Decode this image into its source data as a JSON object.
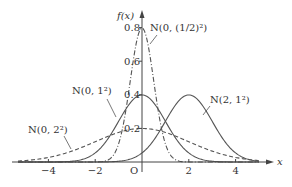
{
  "chart_data": {
    "type": "line",
    "title": "",
    "xlabel": "x",
    "ylabel": "f(x)",
    "xlim": [
      -5.3,
      5
    ],
    "ylim": [
      0,
      0.85
    ],
    "grid": false,
    "legend_position": "inline labels",
    "origin_label": "O",
    "x_ticks": [
      {
        "value": -4,
        "label": "−4"
      },
      {
        "value": -2,
        "label": "−2"
      },
      {
        "value": 2,
        "label": "2"
      },
      {
        "value": 4,
        "label": "4"
      }
    ],
    "y_ticks": [
      {
        "value": 0.2,
        "label": "0.2"
      },
      {
        "value": 0.4,
        "label": "0.4"
      },
      {
        "value": 0.6,
        "label": "0.6"
      },
      {
        "value": 0.8,
        "label": "0.8"
      }
    ],
    "series": [
      {
        "name": "N(0, (1/2)²)",
        "mu": 0,
        "sigma": 0.5,
        "peak": 0.798,
        "style": "dash-dot",
        "label_pos": [
          150,
          31
        ],
        "leader": [
          [
            157,
            35
          ],
          [
            150,
            44
          ]
        ]
      },
      {
        "name": "N(0, 1²)",
        "mu": 0,
        "sigma": 1,
        "peak": 0.399,
        "style": "solid",
        "label_pos": [
          72,
          94
        ],
        "leader": [
          [
            107,
            99
          ],
          [
            116,
            117
          ]
        ]
      },
      {
        "name": "N(2, 1²)",
        "mu": 2,
        "sigma": 1,
        "peak": 0.399,
        "style": "solid",
        "label_pos": [
          210,
          103
        ],
        "leader": [
          [
            210,
            106
          ],
          [
            203,
            115
          ]
        ]
      },
      {
        "name": "N(0, 2²)",
        "mu": 0,
        "sigma": 2,
        "peak": 0.199,
        "style": "dashed",
        "label_pos": [
          28,
          133
        ],
        "leader": [
          [
            64,
            136
          ],
          [
            71,
            149
          ]
        ]
      }
    ]
  },
  "axes": {
    "x_label": "x",
    "y_label": "f(x)",
    "origin": "O"
  }
}
